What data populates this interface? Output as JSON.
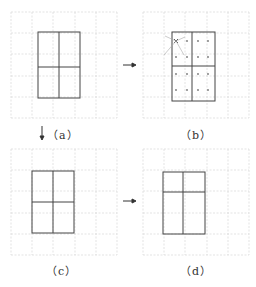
{
  "figure": {
    "panels": [
      {
        "id": "a",
        "label": "（a）",
        "grid": {
          "x": 11,
          "y": 12,
          "cols": 5,
          "rows": 5,
          "step": 21.2
        },
        "rect": {
          "x": 38,
          "y": 32,
          "w": 42,
          "h": 66,
          "vsplit": 59,
          "hsplit": 67
        }
      },
      {
        "id": "b",
        "label": "（b）",
        "grid": {
          "x": 143,
          "y": 12,
          "cols": 5,
          "rows": 5,
          "step": 21.2
        },
        "rect": {
          "x": 172,
          "y": 32,
          "w": 43,
          "h": 69,
          "vsplit": 192,
          "hsplit": 66
        },
        "dots": {
          "xs": [
            176,
            187,
            198,
            208
          ],
          "ys": [
            41,
            57,
            74,
            90
          ]
        },
        "cross_mark": {
          "x": 176,
          "y": 41
        }
      },
      {
        "id": "c",
        "label": "（c）",
        "grid": {
          "x": 11,
          "y": 149,
          "cols": 5,
          "rows": 5,
          "step": 21.2
        },
        "rect": {
          "x": 32,
          "y": 171,
          "w": 42,
          "h": 62,
          "vsplit": 53,
          "hsplit": 202
        }
      },
      {
        "id": "d",
        "label": "（d）",
        "grid": {
          "x": 143,
          "y": 149,
          "cols": 5,
          "rows": 5,
          "step": 21.2
        },
        "rect": {
          "x": 163,
          "y": 172,
          "w": 42,
          "h": 62,
          "vsplit": 183,
          "hsplit": 192
        }
      }
    ],
    "arrows": [
      {
        "from": "a",
        "to": "b",
        "direction": "right",
        "glyph": "→"
      },
      {
        "from": "a",
        "to": "c",
        "direction": "down",
        "glyph": "↓"
      },
      {
        "from": "c",
        "to": "d",
        "direction": "right",
        "glyph": "→"
      }
    ],
    "colors": {
      "grid": "#dcdcdc",
      "rect": "#444444",
      "dots": "#777777",
      "cross": "#555555",
      "text": "#333333"
    }
  }
}
